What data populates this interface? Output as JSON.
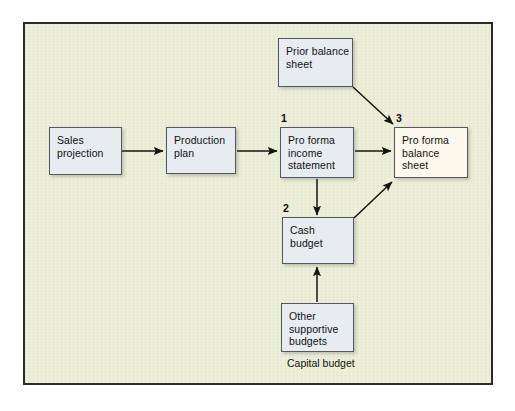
{
  "diagram": {
    "frame": {
      "background_color": "#ecedd7",
      "border_color": "#2b2b28"
    },
    "node_style": {
      "fill": "#e6ecf0",
      "accent_fill": "#fdf8ec",
      "border": "#55585a"
    },
    "nodes": [
      {
        "id": "sales-projection",
        "lines": [
          "Sales",
          "projection"
        ],
        "step": "",
        "accent": false
      },
      {
        "id": "production-plan",
        "lines": [
          "Production",
          "plan"
        ],
        "step": "",
        "accent": false
      },
      {
        "id": "prior-balance-sheet",
        "lines": [
          "Prior balance",
          "sheet"
        ],
        "step": "",
        "accent": false
      },
      {
        "id": "pro-forma-income-statement",
        "lines": [
          "Pro forma",
          "income",
          "statement"
        ],
        "step": "1",
        "accent": false
      },
      {
        "id": "cash-budget",
        "lines": [
          "Cash",
          "budget"
        ],
        "step": "2",
        "accent": false
      },
      {
        "id": "other-supportive-budgets",
        "lines": [
          "Other",
          "supportive",
          "budgets"
        ],
        "step": "",
        "accent": false
      },
      {
        "id": "pro-forma-balance-sheet",
        "lines": [
          "Pro forma",
          "balance",
          "sheet"
        ],
        "step": "3",
        "accent": true
      }
    ],
    "step_labels": {
      "one": "1",
      "two": "2",
      "three": "3"
    },
    "caption": "Capital budget",
    "connectors": [
      {
        "from": "sales-projection",
        "to": "production-plan",
        "kind": "horizontal-arrow"
      },
      {
        "from": "production-plan",
        "to": "pro-forma-income-statement",
        "kind": "horizontal-arrow"
      },
      {
        "from": "pro-forma-income-statement",
        "to": "pro-forma-balance-sheet",
        "kind": "horizontal-arrow"
      },
      {
        "from": "pro-forma-income-statement",
        "to": "cash-budget",
        "kind": "vertical-arrow-down"
      },
      {
        "from": "other-supportive-budgets",
        "to": "cash-budget",
        "kind": "vertical-arrow-up"
      },
      {
        "from": "prior-balance-sheet",
        "to": "pro-forma-balance-sheet",
        "kind": "diagonal-arrow-down-right"
      },
      {
        "from": "cash-budget",
        "to": "pro-forma-balance-sheet",
        "kind": "diagonal-arrow-up-right"
      }
    ]
  }
}
